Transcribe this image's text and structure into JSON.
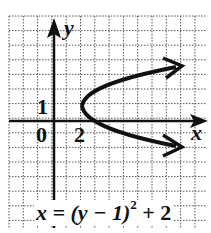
{
  "diagram": {
    "type": "parabola-graph",
    "axes": {
      "x_label": "x",
      "y_label": "y",
      "origin_label": "0"
    },
    "tick_labels": {
      "x": "2",
      "y": "1"
    },
    "equation": {
      "lhs": "x = (y − 1)",
      "exponent": "2",
      "rhs": " + 2"
    },
    "vertex": [
      2,
      1
    ],
    "colors": {
      "ink": "#111111",
      "grid": "#555555",
      "background": "#ffffff"
    }
  }
}
